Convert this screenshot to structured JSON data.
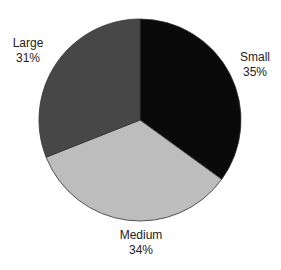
{
  "chart_data": {
    "type": "pie",
    "title": "",
    "categories": [
      "Small",
      "Medium",
      "Large"
    ],
    "values": [
      35,
      34,
      31
    ],
    "unit": "%",
    "start_angle_deg": 0,
    "direction": "clockwise",
    "slices": [
      {
        "label": "Small",
        "value": 35,
        "display": "35%",
        "color": "#0a0a0a",
        "label_pos": [
          255,
          50
        ]
      },
      {
        "label": "Medium",
        "value": 34,
        "display": "34%",
        "color": "#bdbdbd",
        "label_pos": [
          141,
          228
        ]
      },
      {
        "label": "Large",
        "value": 31,
        "display": "31%",
        "color": "#474747",
        "label_pos": [
          28,
          36
        ]
      }
    ],
    "legend": "none (direct slice labels)",
    "center": [
      140,
      120
    ],
    "radius": 101,
    "outline_color": "#333333"
  }
}
